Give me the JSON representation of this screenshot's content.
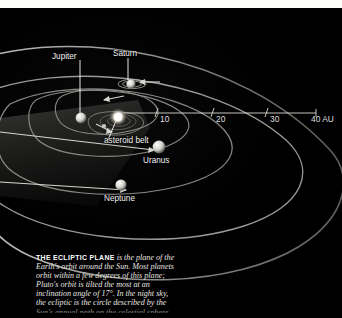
{
  "figure": {
    "kind": "solar-system-ecliptic-plane-diagram",
    "background_color": "#000000",
    "paper_color": "#fdfdfb",
    "orbit_color": "#b9b9b4",
    "label_color": "#f2f2f2"
  },
  "labels": {
    "jupiter": "Jupiter",
    "saturn": "Saturn",
    "asteroid_belt": "asteroid belt",
    "uranus": "Uranus",
    "neptune": "Neptune"
  },
  "axis": {
    "unit": "AU",
    "ticks": [
      {
        "value": "10",
        "label": "10"
      },
      {
        "value": "20",
        "label": "20"
      },
      {
        "value": "30",
        "label": "30"
      },
      {
        "value": "40",
        "label": "40 AU"
      }
    ]
  },
  "caption": {
    "lead": "THE ECLIPTIC PLANE",
    "lines": [
      "is the plane of the",
      "Earth's orbit around the Sun. Most planets",
      "orbit within a few degrees of this plane;",
      "Pluto's orbit is tilted the most at an",
      "inclination angle of 17°. In the night sky,",
      "the ecliptic is the circle described by the"
    ],
    "clipped_line": "Sun's annual path on the celestial sphere"
  }
}
